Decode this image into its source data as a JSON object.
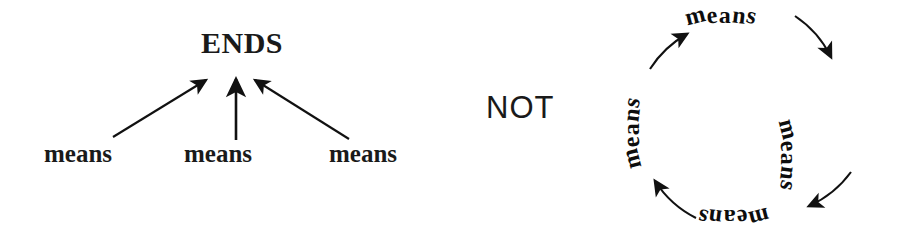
{
  "figure": {
    "background_color": "#ffffff",
    "ink_color": "#1a1a1a"
  },
  "left_diagram": {
    "name": "means-to-ends-hierarchy",
    "ends_label": "ENDS",
    "means_labels": [
      "means",
      "means",
      "means"
    ],
    "arrow_count": 3,
    "arrow_direction": "means-point-up-to-ends"
  },
  "connector": {
    "label": "NOT"
  },
  "right_diagram": {
    "name": "circular-means-regress",
    "means_labels": [
      "means",
      "means",
      "means",
      "means"
    ],
    "positions": [
      "top",
      "right",
      "bottom",
      "left"
    ],
    "arrow_count": 4,
    "arrow_direction": "clockwise-endless-loop"
  }
}
